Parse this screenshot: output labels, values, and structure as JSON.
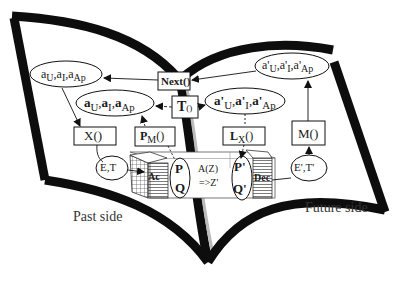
{
  "diagram": {
    "type": "open-book process diagram",
    "colors": {
      "stroke": "#111111",
      "book_outline": "#0d0d0d",
      "background": "#ffffff",
      "label_text": "#333333"
    },
    "sides": {
      "past": "Past side",
      "future": "Future side"
    },
    "nodes": {
      "past_params_top": {
        "label_html": "a<sub>U</sub>,a<sub>I</sub>,a<sub>Ap</sub>",
        "shape": "ellipse"
      },
      "past_params_bold": {
        "label_html": "<b>a</b><sub>U</sub>,<b>a</b><sub>I</sub>,<b>a</b><sub>Ap</sub>",
        "shape": "ellipse"
      },
      "future_params_top": {
        "label_html": "a'<sub>U</sub>,a'<sub>I</sub>,a'<sub>Ap</sub>",
        "shape": "ellipse"
      },
      "future_params_bold": {
        "label_html": "<b>a'</b><sub>U</sub>,<b>a'</b><sub>I</sub>,<b>a'</b><sub>Ap</sub>",
        "shape": "ellipse"
      },
      "next": {
        "label": "Next()",
        "shape": "box"
      },
      "t": {
        "label_html": "<b>T</b><span style='font-size:9px'>()</span>",
        "shape": "box"
      },
      "x": {
        "label": "X()",
        "shape": "box"
      },
      "pm": {
        "label_html": "<b>P</b><sub>M</sub>()",
        "shape": "box"
      },
      "lx": {
        "label_html": "<b>L</b><sub>X</sub>()",
        "shape": "box"
      },
      "m": {
        "label": "M()",
        "shape": "box"
      },
      "et": {
        "label": "E,T",
        "shape": "ellipse"
      },
      "et_prime": {
        "label": "E',T'",
        "shape": "ellipse"
      },
      "ac": {
        "label": "Ac",
        "shape": "grid-block"
      },
      "dec": {
        "label": "Dec",
        "shape": "striped-block"
      },
      "pq": {
        "label_p": "P",
        "label_q": "Q",
        "shape": "ellipse"
      },
      "pq_prime": {
        "label_p": "P'",
        "label_q": "Q'",
        "shape": "ellipse"
      },
      "transform": {
        "line1": "A(Z)",
        "line2": "=>Z'"
      }
    },
    "edges": [
      {
        "from": "next",
        "to": "past_params_top",
        "style": "solid"
      },
      {
        "from": "future_params_top",
        "to": "next",
        "style": "solid"
      },
      {
        "from": "past_params_top",
        "to": "x",
        "style": "solid"
      },
      {
        "from": "t",
        "to": "past_params_bold",
        "style": "dashed"
      },
      {
        "from": "t",
        "to": "future_params_bold",
        "style": "dashed"
      },
      {
        "from": "pm",
        "to": "past_params_bold",
        "style": "dashed"
      },
      {
        "from": "future_params_bold",
        "to": "lx",
        "style": "dashed"
      },
      {
        "from": "m",
        "to": "future_params_top",
        "style": "solid"
      },
      {
        "from": "x",
        "to": "et",
        "style": "solid"
      },
      {
        "from": "et",
        "to": "ac",
        "style": "solid"
      },
      {
        "from": "pm",
        "to": "pq",
        "style": "dashed"
      },
      {
        "from": "lx",
        "to": "pq_prime",
        "style": "dashed"
      },
      {
        "from": "dec",
        "to": "et_prime",
        "style": "solid"
      },
      {
        "from": "et_prime",
        "to": "m",
        "style": "solid"
      }
    ]
  }
}
